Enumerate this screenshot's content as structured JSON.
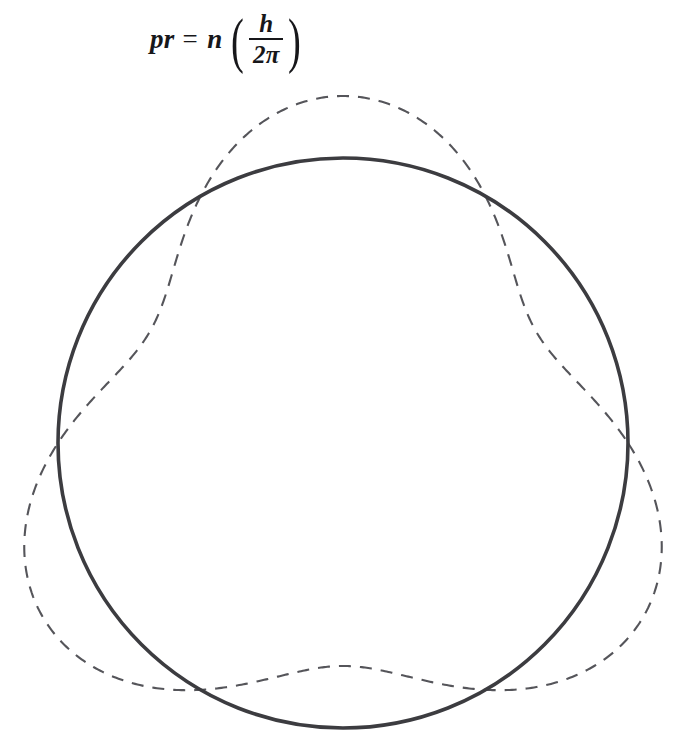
{
  "figure": {
    "background_color": "#ffffff",
    "width": 673,
    "height": 747
  },
  "equation": {
    "full_text": "pr = n (h/2π)",
    "lhs": "pr",
    "equals": "=",
    "coefficient": "n",
    "paren_open": "(",
    "paren_close": ")",
    "numerator": "h",
    "denominator": "2π",
    "style": "bold-italic-serif",
    "color": "#17171a"
  },
  "chart_data": {
    "type": "line",
    "xlabel": "",
    "ylabel": "",
    "coordinate_system": "polar",
    "grid": false,
    "legend": false,
    "annotations": [],
    "center": {
      "x": 343,
      "y": 443
    },
    "series": [
      {
        "name": "orbit-circle",
        "style": "solid",
        "stroke_color": "#3c3c40",
        "stroke_width": 3.6,
        "radius": 285,
        "description": "Circular electron orbit of radius r",
        "polar_function": "r(theta) = 285"
      },
      {
        "name": "standing-wave",
        "style": "dashed",
        "stroke_color": "#55555a",
        "stroke_width": 2.1,
        "dash_array": "12 9",
        "wave_number": 3,
        "amplitude": 62,
        "base_radius": 285,
        "phase_degrees": -90,
        "description": "Three-wavelength (n = 3) standing de Broglie wave closing on itself",
        "polar_function": "r(theta) = 285 + 62 * cos(3 * (theta + 90deg))"
      }
    ],
    "extremes": {
      "circle_top": [
        343,
        158
      ],
      "circle_bottom": [
        343,
        728
      ],
      "circle_left": [
        58,
        443
      ],
      "circle_right": [
        628,
        443
      ],
      "wave_top_crest": [
        341,
        97
      ],
      "wave_left_crest": [
        21,
        556
      ],
      "wave_right_crest": [
        662,
        556
      ]
    },
    "intersections": [
      [
        222,
        186
      ],
      [
        462,
        185
      ],
      [
        60,
        465
      ],
      [
        627,
        465
      ],
      [
        182,
        677
      ],
      [
        505,
        678
      ]
    ]
  }
}
